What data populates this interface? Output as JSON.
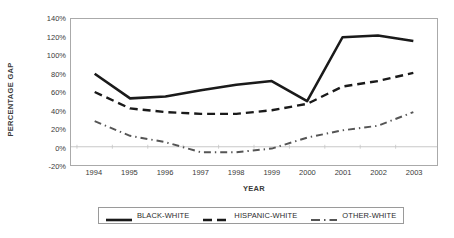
{
  "chart_data": {
    "type": "line",
    "title": "",
    "xlabel": "YEAR",
    "ylabel": "PERCENTAGE GAP",
    "x": [
      1994,
      1995,
      1996,
      1997,
      1998,
      1999,
      2000,
      2001,
      2002,
      2003
    ],
    "categories": [
      "1994",
      "1995",
      "1996",
      "1997",
      "1998",
      "1999",
      "2000",
      "2001",
      "2002",
      "2003"
    ],
    "ylim": [
      -20,
      140
    ],
    "yticks": [
      -20,
      0,
      20,
      40,
      60,
      80,
      100,
      120,
      140
    ],
    "ytick_labels": [
      "-20%",
      "0%",
      "20%",
      "40%",
      "60%",
      "80%",
      "100%",
      "120%",
      "140%"
    ],
    "grid": false,
    "legend_position": "bottom",
    "series": [
      {
        "name": "BLACK-WHITE",
        "style": "solid",
        "color": "#1a1a1a",
        "values": [
          80,
          53,
          55,
          62,
          68,
          72,
          50,
          120,
          122,
          116
        ]
      },
      {
        "name": "HISPANIC-WHITE",
        "style": "dashed",
        "color": "#1a1a1a",
        "values": [
          60,
          42,
          38,
          36,
          36,
          40,
          47,
          66,
          72,
          81
        ]
      },
      {
        "name": "OTHER-WHITE",
        "style": "dashdot",
        "color": "#555555",
        "values": [
          28,
          12,
          5,
          -6,
          -6,
          -2,
          10,
          18,
          23,
          38
        ]
      }
    ]
  },
  "legend": {
    "items": [
      {
        "label": "BLACK-WHITE",
        "style": "solid"
      },
      {
        "label": "HISPANIC-WHITE",
        "style": "dashed"
      },
      {
        "label": "OTHER-WHITE",
        "style": "dashdot"
      }
    ]
  }
}
